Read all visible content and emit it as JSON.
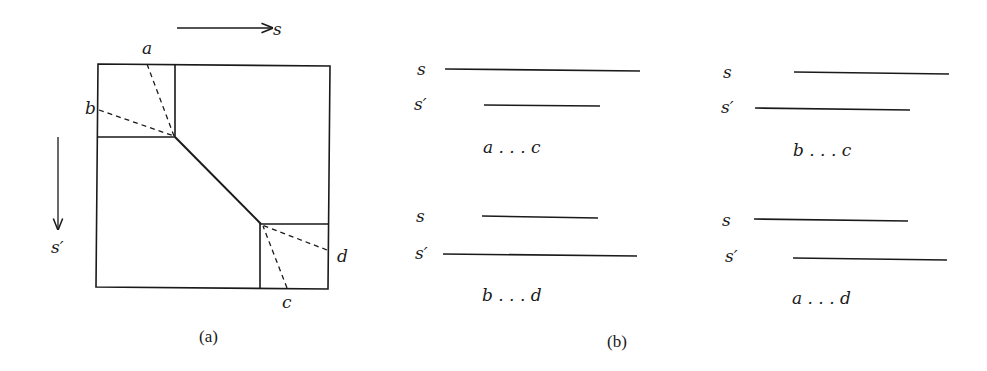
{
  "figure": {
    "panel_a": {
      "caption": "(a)",
      "axis_s": "s",
      "axis_s_prime": "s′",
      "corner_labels": {
        "a": "a",
        "b": "b",
        "c": "c",
        "d": "d"
      }
    },
    "panel_b": {
      "caption": "(b)",
      "cases": [
        {
          "s_label": "s",
          "s_prime_label": "s′",
          "range": "a . . . c"
        },
        {
          "s_label": "s",
          "s_prime_label": "s′",
          "range": "b . . . c"
        },
        {
          "s_label": "s",
          "s_prime_label": "s′",
          "range": "b . . . d"
        },
        {
          "s_label": "s",
          "s_prime_label": "s′",
          "range": "a . . . d"
        }
      ]
    }
  }
}
